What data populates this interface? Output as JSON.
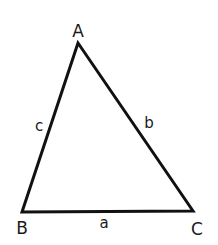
{
  "diagram": {
    "type": "triangle",
    "colors": {
      "stroke": "#111111",
      "text": "#1a1a1a",
      "background": "#ffffff"
    },
    "vertices": [
      {
        "id": "A",
        "label": "A",
        "x": 78,
        "y": 43
      },
      {
        "id": "B",
        "label": "B",
        "x": 22,
        "y": 212
      },
      {
        "id": "C",
        "label": "C",
        "x": 193,
        "y": 211
      }
    ],
    "sides": [
      {
        "id": "a",
        "label": "a",
        "from": "B",
        "to": "C"
      },
      {
        "id": "b",
        "label": "b",
        "from": "A",
        "to": "C"
      },
      {
        "id": "c",
        "label": "c",
        "from": "A",
        "to": "B"
      }
    ]
  }
}
